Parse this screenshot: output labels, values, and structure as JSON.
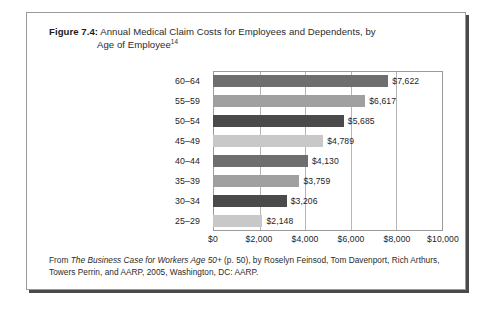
{
  "figure": {
    "label": "Figure 7.4:",
    "title_line1": "Annual Medical Claim Costs for Employees and Dependents, by",
    "title_line2": "Age of Employee",
    "footnote_marker": "14"
  },
  "source_note": {
    "prefix": "From ",
    "italic_title": "The Business Case for Workers Age 50+",
    "suffix": " (p. 50), by Roselyn Feinsod, Tom Davenport, Rich Arthurs, Towers Perrin, and AARP, 2005, Washington, DC:  AARP."
  },
  "chart_data": {
    "type": "bar",
    "orientation": "horizontal",
    "title": "Annual Medical Claim Costs for Employees and Dependents, by Age of Employee",
    "xlabel": "",
    "ylabel": "",
    "categories": [
      "60–64",
      "55–59",
      "50–54",
      "45–49",
      "40–44",
      "35–39",
      "30–34",
      "25–29"
    ],
    "values": [
      7622,
      6617,
      5685,
      4789,
      4130,
      3759,
      3206,
      2148
    ],
    "value_labels": [
      "$7,622",
      "$6,617",
      "$5,685",
      "$4,789",
      "$4,130",
      "$3,759",
      "$3,206",
      "$2,148"
    ],
    "bar_colors": [
      "#6e6e6e",
      "#a0a0a0",
      "#4a4a4a",
      "#c8c8c8",
      "#6e6e6e",
      "#a0a0a0",
      "#4a4a4a",
      "#c8c8c8"
    ],
    "xlim": [
      0,
      10000
    ],
    "xticks": [
      0,
      2000,
      4000,
      6000,
      8000,
      10000
    ],
    "xtick_labels": [
      "$0",
      "$2,000",
      "$4,000",
      "$6,000",
      "$8,000",
      "$10,000"
    ],
    "grid": "vertical",
    "legend": "none"
  }
}
